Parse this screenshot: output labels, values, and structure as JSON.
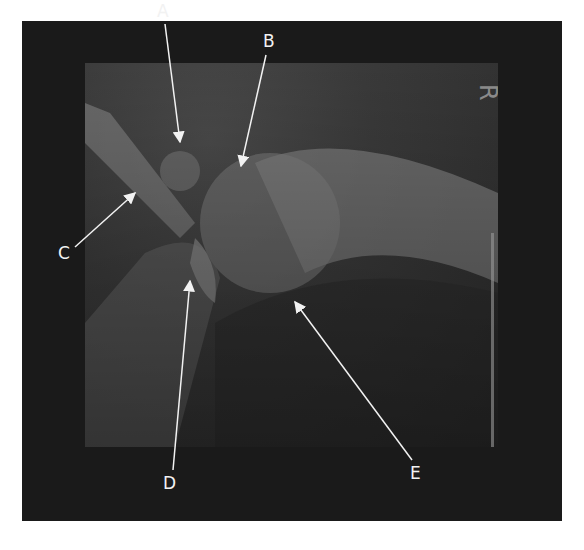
{
  "figure": {
    "type": "annotated-radiograph",
    "side_marker": "R",
    "colors": {
      "frame": "#1a1a1a",
      "annotation": "#f2f2f2",
      "page": "#ffffff"
    }
  },
  "labels": [
    {
      "id": "A",
      "text": "A",
      "x": 157,
      "y": 3,
      "arrow": {
        "x1": 165,
        "y1": 24,
        "x2": 180,
        "y2": 142
      }
    },
    {
      "id": "B",
      "text": "B",
      "x": 263,
      "y": 33,
      "arrow": {
        "x1": 266,
        "y1": 55,
        "x2": 241,
        "y2": 166
      }
    },
    {
      "id": "C",
      "text": "C",
      "x": 58,
      "y": 245,
      "arrow": {
        "x1": 75,
        "y1": 247,
        "x2": 135,
        "y2": 193
      }
    },
    {
      "id": "D",
      "text": "D",
      "x": 163,
      "y": 475,
      "arrow": {
        "x1": 173,
        "y1": 470,
        "x2": 190,
        "y2": 281
      }
    },
    {
      "id": "E",
      "text": "E",
      "x": 410,
      "y": 465,
      "arrow": {
        "x1": 412,
        "y1": 460,
        "x2": 295,
        "y2": 302
      }
    }
  ]
}
